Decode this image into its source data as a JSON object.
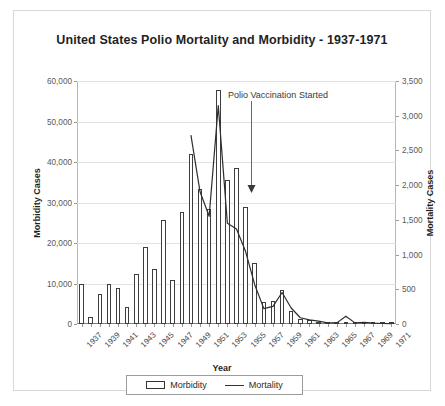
{
  "chart_data": {
    "type": "bar",
    "title": "United States Polio Mortality and Morbidity - 1937-1971",
    "xlabel": "Year",
    "ylabel": "Morbidity Cases",
    "y2label": "Mortality Cases",
    "ylim": [
      0,
      60000
    ],
    "y2lim": [
      0,
      3500
    ],
    "yticks": [
      "0",
      "10,000",
      "20,000",
      "30,000",
      "40,000",
      "50,000",
      "60,000"
    ],
    "ytick_values": [
      0,
      10000,
      20000,
      30000,
      40000,
      50000,
      60000
    ],
    "y2ticks": [
      "0",
      "500",
      "1,000",
      "1,500",
      "2,000",
      "2,500",
      "3,000",
      "3,500"
    ],
    "y2tick_values": [
      0,
      500,
      1000,
      1500,
      2000,
      2500,
      3000,
      3500
    ],
    "grid": true,
    "legend_position": "bottom",
    "legend": [
      "Morbidity",
      "Mortality"
    ],
    "annotations": [
      {
        "text": "Polio Vaccination Started",
        "year": 1955,
        "arrow": "down"
      }
    ],
    "categories": [
      "1937",
      "1938",
      "1939",
      "1940",
      "1941",
      "1942",
      "1943",
      "1944",
      "1945",
      "1946",
      "1947",
      "1948",
      "1949",
      "1950",
      "1951",
      "1952",
      "1953",
      "1954",
      "1955",
      "1956",
      "1957",
      "1958",
      "1959",
      "1960",
      "1961",
      "1962",
      "1963",
      "1964",
      "1965",
      "1966",
      "1967",
      "1968",
      "1969",
      "1970",
      "1971"
    ],
    "tick_labels": [
      "1937",
      "",
      "1939",
      "",
      "1941",
      "",
      "1943",
      "",
      "1945",
      "",
      "1947",
      "",
      "1949",
      "",
      "1951",
      "",
      "1953",
      "",
      "1955",
      "",
      "1957",
      "",
      "1959",
      "",
      "1961",
      "",
      "1963",
      "",
      "1965",
      "",
      "1967",
      "",
      "1969",
      "",
      "1971"
    ],
    "series": [
      {
        "name": "Morbidity",
        "axis": "left",
        "type": "bar",
        "values": [
          10000,
          1700,
          7300,
          9800,
          9000,
          4100,
          12400,
          19000,
          13600,
          25600,
          10800,
          27700,
          42000,
          33300,
          28400,
          57900,
          35600,
          38500,
          28900,
          15100,
          5500,
          5800,
          8400,
          3200,
          1300,
          900,
          500,
          120,
          70,
          110,
          40,
          55,
          20,
          33,
          21
        ]
      },
      {
        "name": "Mortality",
        "axis": "right",
        "type": "line",
        "values": [
          null,
          null,
          null,
          null,
          null,
          null,
          null,
          null,
          null,
          null,
          null,
          null,
          2720,
          1904,
          1551,
          3145,
          1450,
          1368,
          1043,
          566,
          221,
          255,
          454,
          230,
          90,
          60,
          41,
          17,
          16,
          113,
          16,
          24,
          13,
          7,
          5
        ]
      }
    ]
  }
}
